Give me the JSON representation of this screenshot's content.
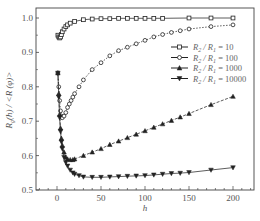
{
  "chart_data": {
    "type": "line",
    "title": "",
    "xlabel": "h",
    "ylabel": "R_g(h) / <R(φ)>",
    "xlim": [
      -25,
      222
    ],
    "ylim": [
      0.5,
      1.02
    ],
    "xticks": [
      0,
      50,
      100,
      150,
      200
    ],
    "yticks": [
      0.5,
      0.6,
      0.7,
      0.8,
      0.9,
      1.0
    ],
    "grid": false,
    "legend_position": "upper right",
    "series": [
      {
        "name": "R2 / R1 = 10",
        "marker": "square-open",
        "x": [
          1,
          2,
          3,
          4,
          5,
          6,
          8,
          10,
          12,
          15,
          20,
          30,
          40,
          50,
          60,
          70,
          80,
          90,
          100,
          110,
          120,
          150,
          175,
          200
        ],
        "values": [
          0.95,
          0.945,
          0.942,
          0.945,
          0.952,
          0.96,
          0.968,
          0.975,
          0.98,
          0.985,
          0.99,
          0.995,
          0.997,
          0.998,
          0.998,
          0.999,
          0.999,
          0.999,
          0.999,
          0.999,
          0.999,
          1.0,
          1.0,
          1.0
        ]
      },
      {
        "name": "R2 / R1 = 100",
        "marker": "circle-open",
        "x": [
          1,
          2,
          3,
          4,
          5,
          6,
          8,
          10,
          12,
          14,
          16,
          18,
          20,
          25,
          30,
          40,
          50,
          60,
          70,
          80,
          90,
          100,
          110,
          120,
          130,
          140,
          150,
          175,
          200
        ],
        "values": [
          0.84,
          0.8,
          0.76,
          0.73,
          0.715,
          0.71,
          0.715,
          0.725,
          0.74,
          0.75,
          0.76,
          0.77,
          0.78,
          0.8,
          0.82,
          0.85,
          0.87,
          0.89,
          0.905,
          0.915,
          0.925,
          0.935,
          0.945,
          0.952,
          0.958,
          0.963,
          0.968,
          0.975,
          0.98
        ]
      },
      {
        "name": "R2 / R1 = 1000",
        "marker": "triangle-up",
        "x": [
          1,
          2,
          3,
          4,
          5,
          6,
          8,
          10,
          12,
          15,
          18,
          20,
          30,
          40,
          50,
          60,
          70,
          80,
          90,
          100,
          110,
          120,
          130,
          140,
          150,
          175,
          200
        ],
        "values": [
          0.84,
          0.78,
          0.72,
          0.68,
          0.65,
          0.63,
          0.61,
          0.595,
          0.59,
          0.588,
          0.588,
          0.59,
          0.6,
          0.61,
          0.62,
          0.632,
          0.642,
          0.652,
          0.662,
          0.672,
          0.682,
          0.692,
          0.702,
          0.712,
          0.722,
          0.748,
          0.772
        ]
      },
      {
        "name": "R2 / R1 = 10000",
        "marker": "triangle-down",
        "x": [
          1,
          2,
          3,
          4,
          5,
          6,
          8,
          10,
          12,
          15,
          18,
          20,
          25,
          30,
          40,
          50,
          60,
          70,
          80,
          90,
          100,
          110,
          120,
          130,
          140,
          150,
          175,
          200
        ],
        "values": [
          0.84,
          0.77,
          0.71,
          0.67,
          0.64,
          0.62,
          0.595,
          0.58,
          0.57,
          0.558,
          0.55,
          0.546,
          0.542,
          0.538,
          0.537,
          0.537,
          0.538,
          0.539,
          0.54,
          0.541,
          0.542,
          0.544,
          0.546,
          0.548,
          0.549,
          0.551,
          0.558,
          0.565
        ]
      }
    ]
  },
  "legend": {
    "items": [
      {
        "label": "R2 / R1 = 10",
        "prefix": "R",
        "sub1": "2",
        "mid": " / R",
        "sub2": "1",
        "suffix": " = 10"
      },
      {
        "label": "R2 / R1 = 100",
        "prefix": "R",
        "sub1": "2",
        "mid": " / R",
        "sub2": "1",
        "suffix": " = 100"
      },
      {
        "label": "R2 / R1 = 1000",
        "prefix": "R",
        "sub1": "2",
        "mid": " / R",
        "sub2": "1",
        "suffix": " = 1000"
      },
      {
        "label": "R2 / R1 = 10000",
        "prefix": "R",
        "sub1": "2",
        "mid": " / R",
        "sub2": "1",
        "suffix": " = 10000"
      }
    ]
  },
  "axes": {
    "x_label": "h",
    "y_label_text": "R_g(h) / <R(φ)>",
    "x_tick_labels": [
      "0",
      "50",
      "100",
      "150",
      "200"
    ],
    "y_tick_labels": [
      "0.5",
      "0.6",
      "0.7",
      "0.8",
      "0.9",
      "1.0"
    ]
  }
}
